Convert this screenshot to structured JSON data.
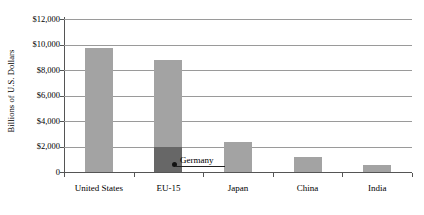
{
  "chart_data": {
    "type": "bar",
    "title": "",
    "xlabel": "",
    "ylabel": "Billions of U.S. Dollars",
    "categories": [
      "United States",
      "EU-15",
      "Japan",
      "China",
      "India"
    ],
    "values": [
      9700,
      8750,
      2350,
      1200,
      560
    ],
    "series": [
      {
        "name": "Gross Domestic Product",
        "values": [
          9700,
          8750,
          2350,
          1200,
          560
        ]
      }
    ],
    "annotations": [
      {
        "label": "Germany",
        "category": "EU-15",
        "value": 2000,
        "note": "Germany shown as darker sub-bar inside the EU-15 bar"
      }
    ],
    "ylim": [
      0,
      12000
    ],
    "ytick_values": [
      0,
      2000,
      4000,
      6000,
      8000,
      10000,
      12000
    ],
    "ytick_labels": [
      "0",
      "$2,000",
      "$4,000",
      "$6,000",
      "$8,000",
      "$10,000",
      "$12,000"
    ],
    "grid": true,
    "legend": "none",
    "colors": {
      "bar": "#a3a3a3",
      "sub_bar": "#676767",
      "gridline": "#9a9a9a",
      "axis": "#555555",
      "text": "#000000",
      "background": "#ffffff"
    }
  }
}
